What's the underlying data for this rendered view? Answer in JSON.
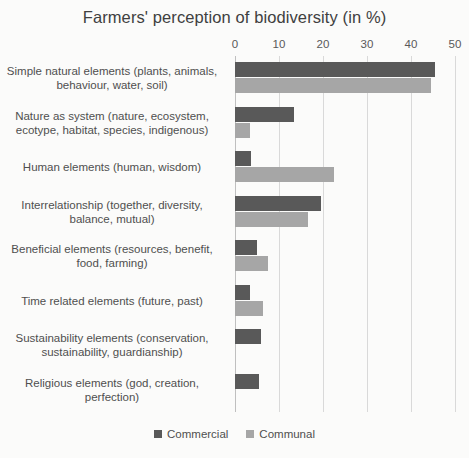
{
  "chart_data": {
    "type": "bar",
    "orientation": "horizontal",
    "title": "Farmers' perception of biodiversity (in %)",
    "xlabel": "",
    "ylabel": "",
    "xlim": [
      0,
      50
    ],
    "xticks": [
      0,
      10,
      20,
      30,
      40,
      50
    ],
    "grid": true,
    "legend_position": "bottom",
    "categories": [
      "Simple natural elements (plants, animals, behaviour, water, soil)",
      "Nature as system (nature, ecosystem, ecotype, habitat, species, indigenous)",
      "Human elements (human, wisdom)",
      "Interrelationship (together, diversity, balance, mutual)",
      "Beneficial elements (resources, benefit, food, farming)",
      "Time related elements (future, past)",
      "Sustainability elements (conservation, sustainability, guardianship)",
      "Religious elements (god, creation, perfection)"
    ],
    "series": [
      {
        "name": "Commercial",
        "color": "#595959",
        "values": [
          45.5,
          13.5,
          3.7,
          19.5,
          5.0,
          3.3,
          6.0,
          5.4
        ]
      },
      {
        "name": "Communal",
        "color": "#a6a6a6",
        "values": [
          44.5,
          3.3,
          22.5,
          16.5,
          7.5,
          6.3,
          0,
          0
        ]
      }
    ]
  },
  "colors": {
    "commercial": "#595959",
    "communal": "#a6a6a6",
    "gridline": "#d9d9d9",
    "axis": "#bfbfbf",
    "text": "#4f4f4f",
    "background": "#fbfbfa"
  }
}
